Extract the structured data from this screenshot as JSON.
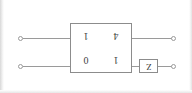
{
  "figure": {
    "type": "two-port-network-diagram",
    "orientation_note": "upside-down-scan",
    "background_color": "#ffffff",
    "line_color": "#9a9a9a",
    "text_color": "#3d3d3d"
  },
  "block": {
    "name": "transmission-matrix-block",
    "matrix": {
      "rows": [
        [
          "1",
          "4"
        ],
        [
          "0",
          "1"
        ]
      ],
      "cells": {
        "r1c1": "1",
        "r1c2": "4",
        "r2c1": "0",
        "r2c2": "1"
      }
    }
  },
  "elements": {
    "z_element": {
      "label": "Z"
    }
  },
  "terminals": {
    "input_top": "",
    "input_bottom": "",
    "output_top": "",
    "output_bottom": ""
  }
}
